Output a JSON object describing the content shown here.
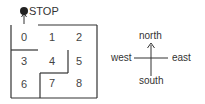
{
  "maze": {
    "stop_label": "STOP",
    "cells": [
      "0",
      "1",
      "2",
      "3",
      "4",
      "5",
      "6",
      "7",
      "8"
    ]
  },
  "compass": {
    "north": "north",
    "south": "south",
    "east": "east",
    "west": "west"
  },
  "colors": {
    "line": "#333333",
    "dot": "#222222"
  }
}
